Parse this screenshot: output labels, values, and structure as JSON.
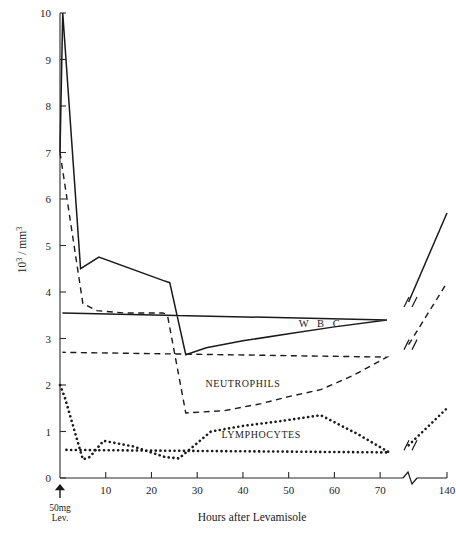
{
  "chart_data": {
    "type": "line",
    "title": "",
    "xlabel": "Hours after Levamisole",
    "ylabel": "10³ / mm³",
    "ylabel_parts": {
      "base": "10",
      "exponent": "3",
      "separator": " / ",
      "unit_base": "mm",
      "unit_exponent": "3"
    },
    "xlim": [
      0,
      140
    ],
    "ylim": [
      0,
      10
    ],
    "grid": false,
    "legend": "inline-labels",
    "axis_break": {
      "present": true,
      "between": [
        75,
        135
      ],
      "axis": "x",
      "note": "zig-zag break on x-axis and on every series"
    },
    "yticks": [
      0,
      1,
      2,
      3,
      4,
      5,
      6,
      7,
      8,
      9,
      10
    ],
    "ytick_labels": [
      "0",
      "1",
      "2",
      "3",
      "4",
      "5",
      "6",
      "7",
      "8",
      "9",
      "10"
    ],
    "xticks": [
      0,
      10,
      20,
      30,
      40,
      50,
      60,
      70,
      140
    ],
    "xtick_labels": [
      "",
      "10",
      "20",
      "30",
      "40",
      "50",
      "60",
      "70",
      "140"
    ],
    "annotations": [
      {
        "name": "dose-arrow",
        "x": 0,
        "text_line1": "50mg",
        "text_line2": "Lev.",
        "symbol": "↑"
      }
    ],
    "series": [
      {
        "name": "W B C",
        "label": "W B C",
        "style": "solid",
        "color": "#1a1a1a",
        "label_x": 57,
        "label_y": 3.25,
        "points": [
          [
            0,
            7.0
          ],
          [
            0.6,
            10.0
          ],
          [
            4.5,
            4.5
          ],
          [
            8.5,
            4.75
          ],
          [
            22.5,
            4.25
          ],
          [
            24.0,
            4.2
          ],
          [
            27.5,
            2.65
          ],
          [
            32.0,
            2.8
          ],
          [
            40.0,
            2.95
          ],
          [
            50.0,
            3.1
          ],
          [
            60.0,
            3.25
          ],
          [
            71.5,
            3.4
          ],
          [
            140.0,
            5.7
          ]
        ]
      },
      {
        "name": "NEUTROPHILS",
        "label": "NEUTROPHILS",
        "style": "dashed",
        "color": "#1a1a1a",
        "label_x": 40,
        "label_y": 1.95,
        "points": [
          [
            0,
            7.0
          ],
          [
            5.0,
            3.75
          ],
          [
            8.0,
            3.6
          ],
          [
            14.0,
            3.55
          ],
          [
            22.5,
            3.55
          ],
          [
            23.5,
            3.5
          ],
          [
            27.5,
            1.4
          ],
          [
            36.0,
            1.45
          ],
          [
            44.0,
            1.6
          ],
          [
            50.0,
            1.75
          ],
          [
            57.0,
            1.9
          ],
          [
            64.0,
            2.2
          ],
          [
            71.5,
            2.6
          ],
          [
            140.0,
            4.2
          ]
        ]
      },
      {
        "name": "LYMPHOCYTES",
        "label": "LYMPHOCYTES",
        "style": "dotted",
        "color": "#1a1a1a",
        "label_x": 44,
        "label_y": 0.85,
        "points": [
          [
            0,
            2.0
          ],
          [
            1.0,
            1.75
          ],
          [
            5.0,
            0.4
          ],
          [
            6.5,
            0.45
          ],
          [
            9.5,
            0.8
          ],
          [
            16.0,
            0.68
          ],
          [
            23.0,
            0.45
          ],
          [
            26.0,
            0.42
          ],
          [
            33.0,
            1.0
          ],
          [
            40.0,
            1.12
          ],
          [
            48.0,
            1.22
          ],
          [
            57.0,
            1.35
          ],
          [
            65.0,
            0.95
          ],
          [
            72.0,
            0.55
          ],
          [
            140.0,
            1.5
          ]
        ]
      }
    ]
  },
  "footer": {
    "partial_text": ""
  }
}
